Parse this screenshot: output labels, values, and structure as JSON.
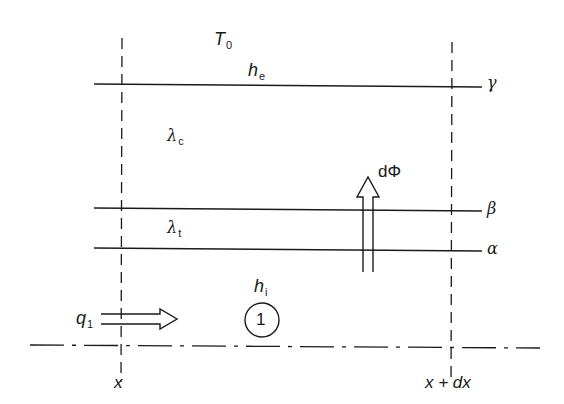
{
  "diagram": {
    "colors": {
      "stroke": "#1a1a1a",
      "background": "#ffffff"
    },
    "labels": {
      "ambient_temp": {
        "main": "T",
        "sub": "0"
      },
      "external_coeff": {
        "main": "h",
        "sub": "e"
      },
      "lambda_c": {
        "main": "λ",
        "sub": "c"
      },
      "lambda_t": {
        "main": "λ",
        "sub": "t"
      },
      "flux": "dΦ",
      "internal_coeff": {
        "main": "h",
        "sub": "i"
      },
      "heat_flow": {
        "main": "q",
        "sub": "1"
      },
      "region_number": "1",
      "surface_gamma": "γ",
      "surface_beta": "β",
      "surface_alpha": "α",
      "x_left": "x",
      "x_right": "x + dx"
    },
    "surfaces": [
      {
        "name": "gamma",
        "y": 84
      },
      {
        "name": "beta",
        "y": 210
      },
      {
        "name": "alpha",
        "y": 249
      }
    ],
    "section_lines": {
      "x_left": 121,
      "x_right": 451
    },
    "axis_line_y": 346
  }
}
